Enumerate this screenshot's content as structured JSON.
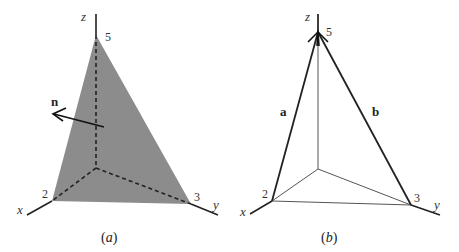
{
  "figure": {
    "panels": [
      {
        "id": "a",
        "caption": "(a)",
        "caption_letter": "a",
        "axes": {
          "x_label": "x",
          "y_label": "y",
          "z_label": "z"
        },
        "intercepts": {
          "x": "2",
          "y": "3",
          "z": "5"
        },
        "normal_label": "n",
        "plane_fill": "#8c8c8c",
        "hidden_axes_style": "dashed"
      },
      {
        "id": "b",
        "caption": "(b)",
        "caption_letter": "b",
        "axes": {
          "x_label": "x",
          "y_label": "y",
          "z_label": "z"
        },
        "intercepts": {
          "x": "2",
          "y": "3",
          "z": "5"
        },
        "vector_labels": {
          "a": "a",
          "b": "b"
        }
      }
    ]
  }
}
